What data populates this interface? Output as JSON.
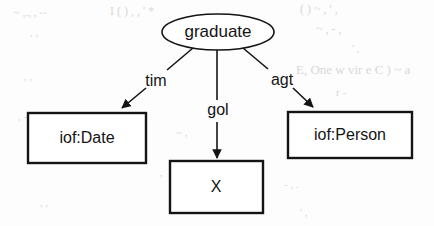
{
  "diagram": {
    "type": "node-link-graph",
    "central_node": {
      "id": "graduate",
      "shape": "ellipse",
      "label": "graduate"
    },
    "nodes": [
      {
        "id": "date",
        "shape": "rectangle",
        "label": "iof:Date"
      },
      {
        "id": "x",
        "shape": "rectangle",
        "label": "X"
      },
      {
        "id": "person",
        "shape": "rectangle",
        "label": "iof:Person"
      }
    ],
    "edges": [
      {
        "from": "graduate",
        "to": "date",
        "label": "tim",
        "direction": "to-target"
      },
      {
        "from": "graduate",
        "to": "x",
        "label": "gol",
        "direction": "to-target"
      },
      {
        "from": "graduate",
        "to": "person",
        "label": "agt",
        "direction": "to-target"
      }
    ],
    "colors": {
      "stroke": "#141414",
      "text": "#141414",
      "node_fill": "#ffffff",
      "background": "#fdfdfd",
      "bleed_through": "#d8d8d8"
    }
  },
  "background_artifacts": [
    {
      "text": "~  ,.,  , --",
      "x": 14,
      "y": 6,
      "size": 11,
      "rotate": -1
    },
    {
      "text": "I (  )  ,  ,  '  *",
      "x": 110,
      "y": 4,
      "size": 12,
      "rotate": 0
    },
    {
      "text": "(   )  ~ ,  ' ,",
      "x": 300,
      "y": 2,
      "size": 12,
      "rotate": 0
    },
    {
      "text": ",  ,",
      "x": 30,
      "y": 26,
      "size": 11,
      "rotate": 0
    },
    {
      "text": "~   ,  -   ,",
      "x": 316,
      "y": 22,
      "size": 12,
      "rotate": 0
    },
    {
      "text": "'  ,",
      "x": 352,
      "y": 42,
      "size": 11,
      "rotate": 0
    },
    {
      "text": "E, One w  vir  e C  )   ~ a",
      "x": 296,
      "y": 62,
      "size": 13,
      "rotate": 0
    },
    {
      "text": ",  ,",
      "x": 24,
      "y": 70,
      "size": 11,
      "rotate": 0
    },
    {
      "text": "r  -",
      "x": 336,
      "y": 86,
      "size": 11,
      "rotate": 0
    },
    {
      "text": ",  -  ,",
      "x": 18,
      "y": 110,
      "size": 11,
      "rotate": 0
    },
    {
      "text": "~   ,",
      "x": 176,
      "y": 126,
      "size": 11,
      "rotate": 0
    },
    {
      "text": ",",
      "x": 160,
      "y": 166,
      "size": 11,
      "rotate": 0
    },
    {
      "text": "-  ,  .",
      "x": 284,
      "y": 178,
      "size": 11,
      "rotate": 0
    },
    {
      "text": ",   ,",
      "x": 40,
      "y": 196,
      "size": 11,
      "rotate": 0
    },
    {
      "text": "'  ,",
      "x": 300,
      "y": 206,
      "size": 11,
      "rotate": 0
    }
  ],
  "geometry": {
    "ellipse": {
      "cx": 218,
      "cy": 32,
      "rx": 56,
      "ry": 18
    },
    "boxes": {
      "date": {
        "x": 28,
        "y": 113,
        "w": 118,
        "h": 50
      },
      "x": {
        "x": 170,
        "y": 161,
        "w": 93,
        "h": 52
      },
      "person": {
        "x": 288,
        "y": 112,
        "w": 124,
        "h": 46
      }
    },
    "label_positions": {
      "tim": {
        "x": 156,
        "y": 82
      },
      "gol": {
        "x": 218,
        "y": 111
      },
      "agt": {
        "x": 282,
        "y": 81
      }
    }
  }
}
